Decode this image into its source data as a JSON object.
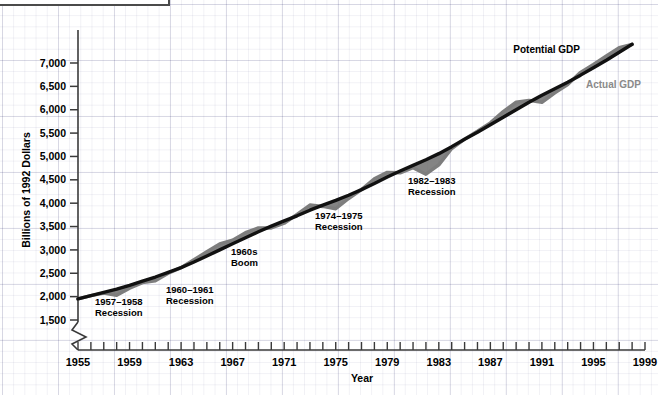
{
  "figure": {
    "caption_box_label": ""
  },
  "chart_data": {
    "type": "line",
    "title": "",
    "xlabel": "Year",
    "ylabel": "Billions of 1992 Dollars",
    "xlim": [
      1955,
      1999
    ],
    "ylim": [
      1500,
      7500
    ],
    "grid": true,
    "y_axis_break": true,
    "legend_position": "upper-right-inline",
    "y_ticks": [
      "1,500",
      "2,000",
      "2,500",
      "3,000",
      "3,500",
      "4,000",
      "4,500",
      "5,000",
      "5,500",
      "6,000",
      "6,500",
      "7,000"
    ],
    "y_tick_values": [
      1500,
      2000,
      2500,
      3000,
      3500,
      4000,
      4500,
      5000,
      5500,
      6000,
      6500,
      7000
    ],
    "x_ticks_labeled": [
      "1955",
      "1959",
      "1963",
      "1967",
      "1971",
      "1975",
      "1979",
      "1983",
      "1987",
      "1991",
      "1995",
      "1999"
    ],
    "x_tick_values_labeled": [
      1955,
      1959,
      1963,
      1967,
      1971,
      1975,
      1979,
      1983,
      1987,
      1991,
      1995,
      1999
    ],
    "x_tick_interval_minor": 1,
    "colors": {
      "potential": "#111111",
      "actual": "#7d7d7d",
      "gap_fill": "#6e6e6e",
      "axis": "#444444",
      "grid": "#dfe0ea"
    },
    "x": [
      1955,
      1956,
      1957,
      1958,
      1959,
      1960,
      1961,
      1962,
      1963,
      1964,
      1965,
      1966,
      1967,
      1968,
      1969,
      1970,
      1971,
      1972,
      1973,
      1974,
      1975,
      1976,
      1977,
      1978,
      1979,
      1980,
      1981,
      1982,
      1983,
      1984,
      1985,
      1986,
      1987,
      1988,
      1989,
      1990,
      1991,
      1992,
      1993,
      1994,
      1995,
      1996,
      1997,
      1998
    ],
    "series": [
      {
        "name": "Potential GDP",
        "color": "#111111",
        "values": [
          1950,
          2020,
          2090,
          2160,
          2240,
          2330,
          2420,
          2520,
          2620,
          2740,
          2870,
          3000,
          3130,
          3260,
          3390,
          3510,
          3620,
          3730,
          3850,
          3960,
          4060,
          4170,
          4290,
          4420,
          4560,
          4690,
          4810,
          4930,
          5060,
          5210,
          5370,
          5520,
          5680,
          5840,
          6000,
          6160,
          6310,
          6450,
          6590,
          6740,
          6900,
          7060,
          7230,
          7400
        ]
      },
      {
        "name": "Actual GDP",
        "color": "#7d7d7d",
        "values": [
          1950,
          2020,
          2075,
          2030,
          2180,
          2300,
          2340,
          2500,
          2620,
          2790,
          2960,
          3130,
          3210,
          3370,
          3470,
          3470,
          3570,
          3760,
          3960,
          3930,
          3880,
          4100,
          4290,
          4520,
          4660,
          4650,
          4760,
          4620,
          4820,
          5170,
          5370,
          5540,
          5720,
          5960,
          6160,
          6200,
          6160,
          6360,
          6540,
          6800,
          6970,
          7150,
          7330,
          7400
        ]
      }
    ],
    "annotations": [
      {
        "id": "recession-1957-1958",
        "line1": "1957–1958",
        "line2": "Recession"
      },
      {
        "id": "recession-1960-1961",
        "line1": "1960–1961",
        "line2": "Recession"
      },
      {
        "id": "boom-1960s",
        "line1": "1960s",
        "line2": "Boom"
      },
      {
        "id": "recession-1974-1975",
        "line1": "1974–1975",
        "line2": "Recession"
      },
      {
        "id": "recession-1982-1983",
        "line1": "1982–1983",
        "line2": "Recession"
      }
    ],
    "legend": [
      {
        "id": "potential-gdp",
        "label": "Potential GDP",
        "color": "#111111"
      },
      {
        "id": "actual-gdp",
        "label": "Actual GDP",
        "color": "#8a8a8a"
      }
    ]
  }
}
